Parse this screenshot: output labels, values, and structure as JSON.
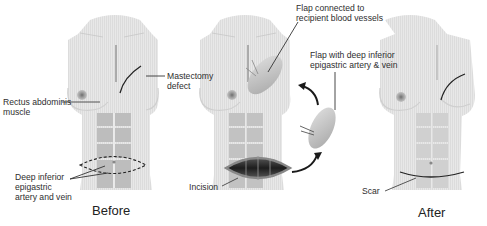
{
  "diagram": {
    "panels": [
      {
        "id": "before",
        "caption": "Before"
      },
      {
        "id": "procedure",
        "caption": ""
      },
      {
        "id": "after",
        "caption": "After"
      }
    ],
    "labels": {
      "mastectomy_line1": "Mastectomy",
      "mastectomy_line2": "defect",
      "rectus_line1": "Rectus abdominis",
      "rectus_line2": "muscle",
      "deep_line1": "Deep inferior",
      "deep_line2": "epigastric",
      "deep_line3": "artery and vein",
      "flap_connected_line1": "Flap connected to",
      "flap_connected_line2": "recipient blood vessels",
      "flap_with_line1": "Flap with deep inferior",
      "flap_with_line2": "epigastric artery & vein",
      "incision": "Incision",
      "scar": "Scar"
    },
    "colors": {
      "skin": "#e6e6e6",
      "skin_shadow": "#d2d2d2",
      "muscle": "#b9b9b9",
      "nipple": "#8a8a8a",
      "flap": "#c8c8c8",
      "line": "#222222"
    }
  }
}
